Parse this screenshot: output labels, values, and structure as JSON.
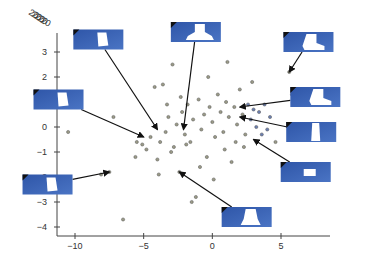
{
  "chart_data": {
    "type": "scatter",
    "title": "",
    "xlabel": "",
    "ylabel": "",
    "xlim": [
      -11.5,
      7.5
    ],
    "ylim": [
      -4.3,
      3.9
    ],
    "x_ticks": [
      -10,
      -5,
      0,
      5
    ],
    "y_ticks": [
      3,
      2,
      1,
      0,
      -1,
      -2,
      -3,
      -4
    ],
    "grid": false,
    "legend": null,
    "top_left_overlapping_label": "20",
    "series": [
      {
        "name": "points",
        "points": [
          [
            -10.5,
            -0.2
          ],
          [
            -8.1,
            -1.9
          ],
          [
            -7.5,
            -1.8
          ],
          [
            -6.5,
            -3.7
          ],
          [
            -7.2,
            0.4
          ],
          [
            -5.5,
            -0.6
          ],
          [
            -5.1,
            -0.7
          ],
          [
            -5.6,
            -1.2
          ],
          [
            -4.8,
            -0.9
          ],
          [
            -4.5,
            -0.4
          ],
          [
            -4.2,
            1.6
          ],
          [
            -4.0,
            -1.3
          ],
          [
            -3.8,
            -0.6
          ],
          [
            -3.6,
            1.7
          ],
          [
            -3.4,
            -0.2
          ],
          [
            -3.2,
            0.4
          ],
          [
            -3.0,
            -1.0
          ],
          [
            -2.8,
            -0.8
          ],
          [
            -2.6,
            0.1
          ],
          [
            -2.4,
            -1.8
          ],
          [
            -2.2,
            0.6
          ],
          [
            -2.0,
            -0.3
          ],
          [
            -1.8,
            0.9
          ],
          [
            -1.6,
            -0.6
          ],
          [
            -1.4,
            0.3
          ],
          [
            -1.2,
            -2.8
          ],
          [
            -1.0,
            1.1
          ],
          [
            -0.8,
            -0.1
          ],
          [
            -0.6,
            0.5
          ],
          [
            -0.4,
            -1.2
          ],
          [
            -0.2,
            0.8
          ],
          [
            0.0,
            0.2
          ],
          [
            0.2,
            -0.4
          ],
          [
            0.4,
            1.3
          ],
          [
            0.6,
            0.6
          ],
          [
            0.8,
            -0.2
          ],
          [
            1.0,
            1.0
          ],
          [
            1.2,
            0.4
          ],
          [
            1.4,
            -1.4
          ],
          [
            1.6,
            0.8
          ],
          [
            1.8,
            0.1
          ],
          [
            2.0,
            1.5
          ],
          [
            2.2,
            0.5
          ],
          [
            2.4,
            -0.3
          ],
          [
            2.6,
            0.9
          ],
          [
            2.8,
            0.3
          ],
          [
            3.0,
            0.7
          ],
          [
            3.2,
            0.0
          ],
          [
            3.4,
            0.6
          ],
          [
            3.6,
            -0.3
          ],
          [
            3.8,
            0.9
          ],
          [
            4.0,
            -0.1
          ],
          [
            4.2,
            0.4
          ],
          [
            5.6,
            2.2
          ],
          [
            5.8,
            1.3
          ],
          [
            4.6,
            -0.6
          ],
          [
            -1.9,
            -0.7
          ],
          [
            -2.3,
            1.2
          ],
          [
            0.9,
            -0.9
          ],
          [
            1.7,
            -0.6
          ],
          [
            -0.9,
            -1.6
          ],
          [
            -3.9,
            -1.9
          ],
          [
            2.9,
            1.8
          ],
          [
            -0.3,
            2.0
          ],
          [
            1.1,
            2.6
          ],
          [
            -2.9,
            2.5
          ],
          [
            0.1,
            -2.1
          ],
          [
            -1.5,
            -3.0
          ],
          [
            -3.3,
            0.9
          ],
          [
            2.3,
            -0.8
          ]
        ]
      }
    ],
    "annotations": [
      {
        "id": "thumb-1",
        "box_x": -8.3,
        "box_y": 3.5,
        "target": [
          -4.0,
          -0.1
        ],
        "shape": "trapezoid-block"
      },
      {
        "id": "thumb-2",
        "box_x": -1.2,
        "box_y": 3.8,
        "target": [
          -2.1,
          -0.1
        ],
        "shape": "boot-bell"
      },
      {
        "id": "thumb-3",
        "box_x": 7.0,
        "box_y": 3.4,
        "target": [
          5.6,
          2.2
        ],
        "shape": "boot"
      },
      {
        "id": "thumb-4",
        "box_x": 7.5,
        "box_y": 1.2,
        "target": [
          2.0,
          0.8
        ],
        "shape": "boot"
      },
      {
        "id": "thumb-5",
        "box_x": -11.2,
        "box_y": 1.1,
        "target": [
          -5.0,
          -0.4
        ],
        "shape": "trapezoid-block"
      },
      {
        "id": "thumb-6",
        "box_x": 7.2,
        "box_y": -0.2,
        "target": [
          2.0,
          0.4
        ],
        "shape": "tall-block"
      },
      {
        "id": "thumb-7",
        "box_x": 6.8,
        "box_y": -1.8,
        "target": [
          3.0,
          -0.5
        ],
        "shape": "small-block"
      },
      {
        "id": "thumb-8",
        "box_x": -12.0,
        "box_y": -2.3,
        "target": [
          -7.5,
          -1.8
        ],
        "shape": "trapezoid-block"
      },
      {
        "id": "thumb-9",
        "box_x": 2.5,
        "box_y": -3.6,
        "target": [
          -2.4,
          -1.8
        ],
        "shape": "bell"
      }
    ],
    "colors": {
      "axis": "#444444",
      "point_fill": "#9a9a86",
      "point_stroke": "#555555",
      "point_blue": "#6b7fb0",
      "thumb_bg": "#2f56a8",
      "thumb_bg_light": "#4a74c4",
      "arrow": "#111111"
    }
  },
  "caption": {
    "text": "faded caption text (illegible)"
  }
}
